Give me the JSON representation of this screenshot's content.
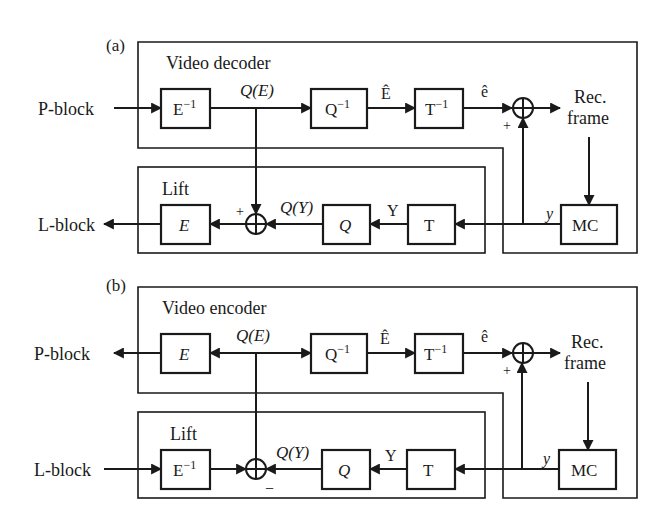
{
  "figure": {
    "panels": [
      {
        "id": "a",
        "label": "(a)",
        "container_title": "Video decoder",
        "lift_title": "Lift",
        "input_label": "P-block",
        "output_label": "L-block",
        "blocks": {
          "entropy": "E",
          "entropy_sup": "−1",
          "inv_quant": "Q",
          "inv_quant_sup": "−1",
          "inv_transform": "T",
          "inv_transform_sup": "−1",
          "lift_entropy": "E",
          "quant": "Q",
          "transform": "T",
          "motion_comp": "MC"
        },
        "signals": {
          "quantized_e": "Q(E)",
          "e_hat_upper": "Ê",
          "e_hat_lower": "ê",
          "rec_frame_line1": "Rec.",
          "rec_frame_line2": "frame",
          "prediction": "y",
          "transformed_pred": "Y",
          "quantized_y": "Q(Y)",
          "sum_top_sign": "+",
          "sum_lift_sign": "+"
        }
      },
      {
        "id": "b",
        "label": "(b)",
        "container_title": "Video encoder",
        "lift_title": "Lift",
        "input_label": "L-block",
        "output_label": "P-block",
        "blocks": {
          "entropy": "E",
          "inv_quant": "Q",
          "inv_quant_sup": "−1",
          "inv_transform": "T",
          "inv_transform_sup": "−1",
          "lift_inv_entropy": "E",
          "lift_inv_entropy_sup": "−1",
          "quant": "Q",
          "transform": "T",
          "motion_comp": "MC"
        },
        "signals": {
          "quantized_e": "Q(E)",
          "e_hat_upper": "Ê",
          "e_hat_lower": "ê",
          "rec_frame_line1": "Rec.",
          "rec_frame_line2": "frame",
          "prediction": "y",
          "transformed_pred": "Y",
          "quantized_y": "Q(Y)",
          "sum_top_sign": "+",
          "sum_lift_sign": "−"
        }
      }
    ]
  }
}
